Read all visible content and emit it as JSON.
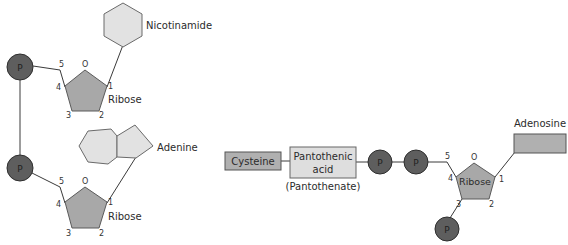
{
  "left_diagram": {
    "name": "NAD",
    "nicotinamide_label": "Nicotinamide",
    "adenine_label": "Adenine",
    "ribose_top_label": "Ribose",
    "ribose_bottom_label": "Ribose",
    "phosphate_label": "P",
    "ring_oxygen": "O",
    "carbon_numbers": {
      "c1": "1",
      "c2": "2",
      "c3": "3",
      "c4": "4",
      "c5": "5"
    }
  },
  "right_diagram": {
    "name": "Coenzyme A",
    "cysteine_label": "Cysteine",
    "pantothenic_line1": "Pantothenic",
    "pantothenic_line2": "acid",
    "pantothenate_label": "(Pantothenate)",
    "adenosine_label": "Adenosine",
    "ribose_label": "Ribose",
    "phosphate_label": "P",
    "ring_oxygen": "O",
    "carbon_numbers": {
      "c1": "1",
      "c2": "2",
      "c3": "3",
      "c4": "4",
      "c5": "5"
    }
  },
  "colors": {
    "phosphate": "#5e5e5e",
    "ribose": "#a8a8a8",
    "ring": "#e2e2e2",
    "box_dark": "#b0b0b0",
    "box_light": "#dedede"
  }
}
